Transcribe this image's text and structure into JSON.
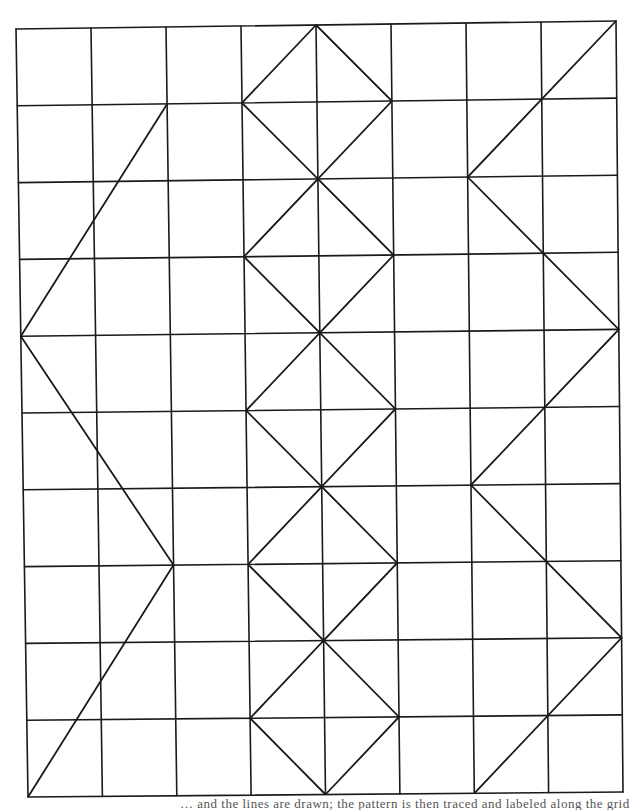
{
  "figure": {
    "columns": 8,
    "rows": 10,
    "corners": {
      "top_left": [
        16,
        29
      ],
      "top_right": [
        616,
        21
      ],
      "bottom_left": [
        28,
        797
      ],
      "bottom_right": [
        623,
        792
      ]
    },
    "line_color": "#1a1a1a",
    "grid_stroke_width": 1.6,
    "diagonal_stroke_width": 1.8,
    "polylines": [
      {
        "name": "left-zigzag",
        "points": [
          [
            2,
            1
          ],
          [
            0,
            4
          ],
          [
            2,
            7
          ],
          [
            0,
            10
          ]
        ]
      },
      {
        "name": "center-left-zigzag",
        "points": [
          [
            4,
            0
          ],
          [
            3,
            1
          ],
          [
            4,
            2
          ],
          [
            3,
            3
          ],
          [
            4,
            4
          ],
          [
            3,
            5
          ],
          [
            4,
            6
          ],
          [
            3,
            7
          ],
          [
            4,
            8
          ],
          [
            3,
            9
          ],
          [
            4,
            10
          ]
        ]
      },
      {
        "name": "center-right-zigzag",
        "points": [
          [
            4,
            0
          ],
          [
            5,
            1
          ],
          [
            4,
            2
          ],
          [
            5,
            3
          ],
          [
            4,
            4
          ],
          [
            5,
            5
          ],
          [
            4,
            6
          ],
          [
            5,
            7
          ],
          [
            4,
            8
          ],
          [
            5,
            9
          ],
          [
            4,
            10
          ]
        ]
      },
      {
        "name": "right-zigzag",
        "points": [
          [
            8,
            0
          ],
          [
            6,
            2
          ],
          [
            8,
            4
          ],
          [
            6,
            6
          ],
          [
            8,
            8
          ],
          [
            6,
            10
          ]
        ]
      }
    ]
  },
  "caption": {
    "text": "… and the lines are drawn; the pattern is then traced and labeled along the grid"
  }
}
